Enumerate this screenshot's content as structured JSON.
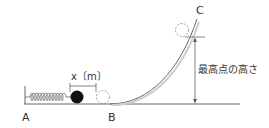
{
  "diagram": {
    "points": {
      "A": "A",
      "B": "B",
      "C": "C"
    },
    "displacement_label": "x〔m〕",
    "height_label": "最高点の高さ"
  },
  "colors": {
    "line": "#555555",
    "ball": "#111111",
    "dashed": "#888888"
  }
}
